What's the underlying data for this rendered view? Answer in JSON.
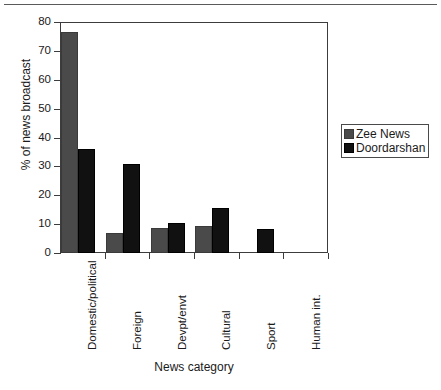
{
  "chart_data": {
    "type": "bar",
    "title": "",
    "xlabel": "News category",
    "ylabel": "% of news broadcast",
    "ylim": [
      0,
      80
    ],
    "ytick_values": [
      0,
      10,
      20,
      30,
      40,
      50,
      60,
      70,
      80
    ],
    "ytick_labels": [
      "0",
      "10",
      "20",
      "30",
      "40",
      "50",
      "60",
      "70",
      "80"
    ],
    "grid": false,
    "legend_position": "right",
    "categories": [
      "Domestic/political",
      "Foreign",
      "Devpt/envt",
      "Cultural",
      "Sport",
      "Human int."
    ],
    "series": [
      {
        "name": "Zee News",
        "color": "#4a4a4a",
        "values": [
          76.5,
          7.0,
          8.5,
          9.5,
          0,
          0
        ]
      },
      {
        "name": "Doordarshan",
        "color": "#111111",
        "values": [
          36.0,
          31.0,
          10.5,
          15.5,
          8.3,
          0
        ]
      }
    ]
  },
  "legend": {
    "entries": [
      {
        "label": "Zee News"
      },
      {
        "label": "Doordarshan"
      }
    ]
  },
  "axes": {
    "y_title": "% of news broadcast",
    "x_title": "News category"
  }
}
